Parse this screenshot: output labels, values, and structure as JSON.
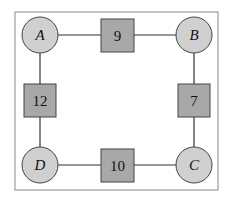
{
  "diagram": {
    "type": "weighted-graph",
    "nodes": [
      {
        "id": "A",
        "label": "A",
        "cx": 40,
        "cy": 35
      },
      {
        "id": "B",
        "label": "B",
        "cx": 194,
        "cy": 35
      },
      {
        "id": "C",
        "label": "C",
        "cx": 194,
        "cy": 165
      },
      {
        "id": "D",
        "label": "D",
        "cx": 40,
        "cy": 165
      }
    ],
    "edges": [
      {
        "from": "A",
        "to": "B",
        "weight": "9"
      },
      {
        "from": "B",
        "to": "C",
        "weight": "7"
      },
      {
        "from": "D",
        "to": "C",
        "weight": "10"
      },
      {
        "from": "A",
        "to": "D",
        "weight": "12"
      }
    ],
    "colors": {
      "node_fill": "#d0d0d0",
      "weight_fill": "#a8a8a8",
      "stroke": "#333333",
      "frame": "#888888"
    }
  }
}
